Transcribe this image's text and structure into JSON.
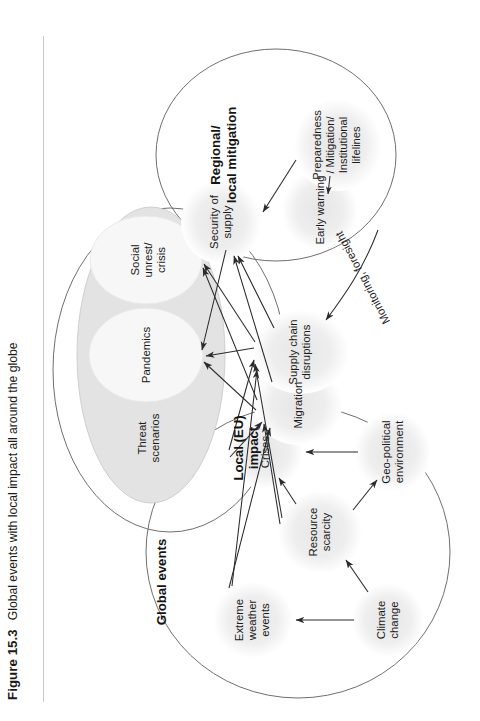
{
  "figure": {
    "number_label": "Figure 15.3",
    "caption": "Global events with local impact all around the globe"
  },
  "diagram": {
    "groups": {
      "global_events": "Global events",
      "local_eu_impact": "Local (EU)\nimpact",
      "local_eu_impact_l1": "Local (EU)",
      "local_eu_impact_l2": "impact",
      "regional_local_mitigation_l1": "Regional/",
      "regional_local_mitigation_l2": "local mitigation"
    },
    "nodes": {
      "climate_change_l1": "Climate",
      "climate_change_l2": "change",
      "extreme_weather_l1": "Extreme",
      "extreme_weather_l2": "weather",
      "extreme_weather_l3": "events",
      "resource_scarcity_l1": "Resource",
      "resource_scarcity_l2": "scarcity",
      "geopolitical_l1": "Geo-political",
      "geopolitical_l2": "environment",
      "crises": "Crises",
      "migration": "Migration",
      "supply_chain_l1": "Supply chain",
      "supply_chain_l2": "disruptions",
      "threat_scenarios_l1": "Threat",
      "threat_scenarios_l2": "scenarios",
      "pandemics": "Pandemics",
      "social_unrest_l1": "Social",
      "social_unrest_l2": "unrest/",
      "social_unrest_l3": "crisis",
      "security_of_supply_l1": "Security of",
      "security_of_supply_l2": "supply",
      "early_warning": "Early warning",
      "preparedness_l1": "Preparedness",
      "preparedness_l2": "/ Mitigation/",
      "preparedness_l3": "Institutional",
      "preparedness_l4": "lifelines"
    },
    "edge_labels": {
      "monitoring_foresight": "Monitoring, foresight"
    },
    "colors": {
      "page_background": "#ffffff",
      "text": "#1a1a1a",
      "hull_stroke": "#6f6f6f",
      "node_blob": "#efefef",
      "threat_ellipse_fill": "#e3e3e3",
      "inner_ellipse_fill": "#f7f7f7",
      "edge_stroke": "#2b2b2b",
      "caption_rule": "#c9c9c9"
    }
  }
}
